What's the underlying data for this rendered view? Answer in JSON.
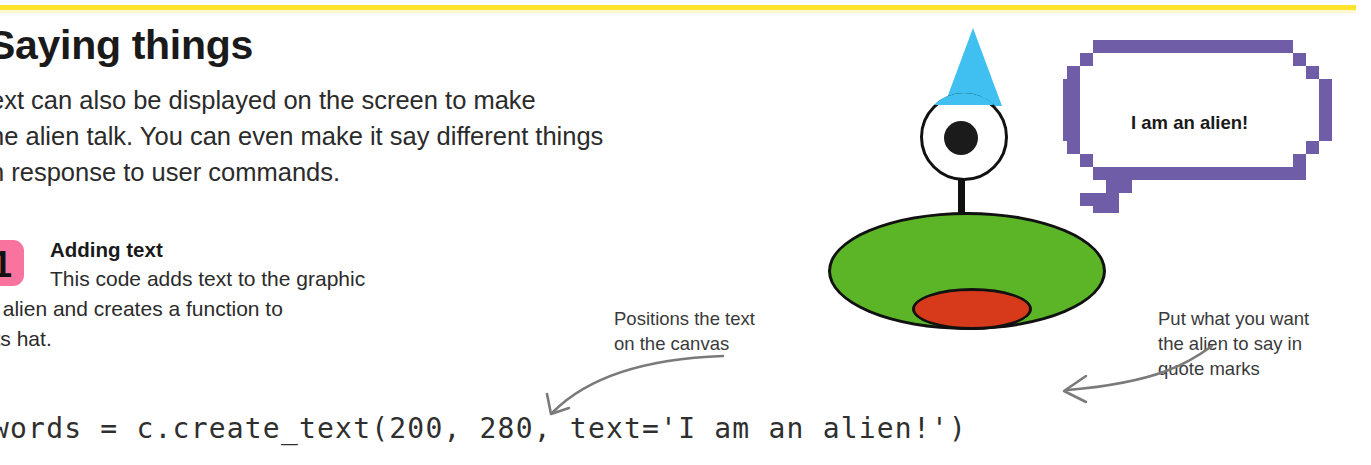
{
  "page": {
    "heading": "Saying things",
    "accent_yellow": "#ffe32e",
    "badge_pink": "#f9739f",
    "bubble_purple": "#6f5da8",
    "alien_green": "#5cb526",
    "alien_hat_blue": "#3fc0f0",
    "alien_mouth_red": "#d63a1a"
  },
  "intro": {
    "line1": "ext can also be displayed on the screen to make",
    "line2": "he alien talk. You can even make it say different things",
    "line3": "n response to user commands."
  },
  "step": {
    "number": "1",
    "title": "Adding text",
    "line1": "This code adds text to the graphic",
    "line2": "f the alien and creates a function to",
    "line3": "eal its hat."
  },
  "callouts": {
    "left": {
      "line1": "Positions the text",
      "line2": "on the canvas"
    },
    "right": {
      "line1": "Put what you want",
      "line2": "the alien to say in",
      "line3": "quote marks"
    }
  },
  "code": {
    "line": "words = c.create_text(200, 280, text='I am an alien!')"
  },
  "illustration": {
    "speech_bubble_text": "I am an alien!"
  }
}
